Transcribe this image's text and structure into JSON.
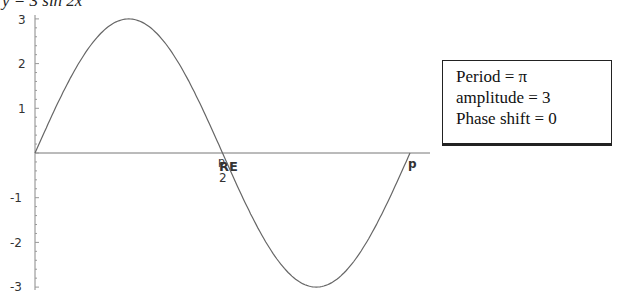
{
  "title": "y = 3 sin 2x",
  "info_box": {
    "lines": [
      "Period = π",
      "amplitude = 3",
      "Phase shift = 0"
    ]
  },
  "axes": {
    "y_ticks": [
      "3",
      "2",
      "1",
      "-1",
      "-2",
      "-3"
    ],
    "x_tick_pi_over_2": "π/2",
    "x_tick_pi_over_2_overlap": "RE",
    "x_tick_pi": "p"
  },
  "chart_data": {
    "type": "line",
    "title": "y = 3 sin 2x",
    "xlabel": "",
    "ylabel": "",
    "x": [
      0,
      0.3927,
      0.7854,
      1.1781,
      1.5708,
      1.9635,
      2.3562,
      2.7489,
      3.1416
    ],
    "series": [
      {
        "name": "3 sin 2x",
        "values": [
          0,
          2.12,
          3,
          2.12,
          0,
          -2.12,
          -3,
          -2.12,
          0
        ]
      }
    ],
    "xlim": [
      0,
      3.1416
    ],
    "ylim": [
      -3,
      3
    ],
    "x_tick_labels": [
      "π/2",
      "π"
    ],
    "y_tick_labels": [
      "-3",
      "-2",
      "-1",
      "1",
      "2",
      "3"
    ],
    "grid": false,
    "annotations": [
      "Period = π",
      "amplitude = 3",
      "Phase shift = 0"
    ]
  }
}
